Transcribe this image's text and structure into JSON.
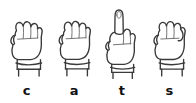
{
  "page": {
    "word": "cats",
    "background_color": "#ffffff",
    "ink_color": "#3a3a3a",
    "label_color": "#111111"
  },
  "signs": [
    {
      "letter": "c",
      "icon": "asl-hand-c-icon",
      "description": "closed fist, thumb at side",
      "extended_finger": false
    },
    {
      "letter": "a",
      "icon": "asl-hand-a-icon",
      "description": "closed fist, thumb alongside index",
      "extended_finger": false
    },
    {
      "letter": "t",
      "icon": "asl-hand-t-icon",
      "description": "fist with index finger extended upward",
      "extended_finger": true
    },
    {
      "letter": "s",
      "icon": "asl-hand-s-icon",
      "description": "closed fist, thumb across front",
      "extended_finger": false
    }
  ]
}
